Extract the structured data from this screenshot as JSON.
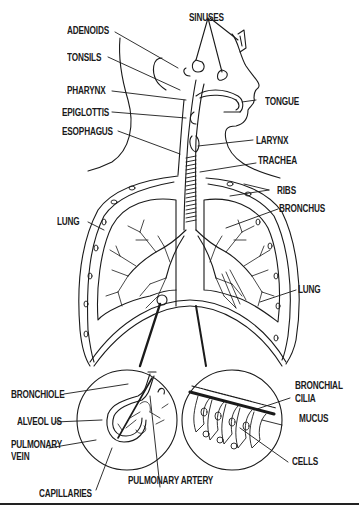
{
  "diagram": {
    "colors": {
      "ink": "#1a1a1a",
      "background": "#ffffff"
    },
    "labels": {
      "adenoids": "ADENOIDS",
      "tonsils": "TONSILS",
      "pharynx": "PHARYNX",
      "epiglottis": "EPIGLOTTIS",
      "esophagus": "ESOPHAGUS",
      "sinuses": "SINUSES",
      "tongue": "TONGUE",
      "larynx": "LARYNX",
      "trachea": "TRACHEA",
      "ribs": "RIBS",
      "bronchus": "BRONCHUS",
      "lung_left": "LUNG",
      "lung_right": "LUNG",
      "bronchiole": "BRONCHIOLE",
      "alveolus": "ALVEOL US",
      "pulmonary_vein_1": "PULMONARY",
      "pulmonary_vein_2": "VEIN",
      "capillaries": "CAPILLARIES",
      "pulmonary_artery": "PULMONARY ARTERY",
      "bronchial_1": "BRONCHIAL",
      "cilia": "CILIA",
      "mucus": "MUCUS",
      "cells": "CELLS"
    },
    "insets": [
      {
        "name": "alveolus-detail",
        "parts": [
          "BRONCHIOLE",
          "ALVEOL US",
          "PULMONARY VEIN",
          "CAPILLARIES",
          "PULMONARY ARTERY"
        ]
      },
      {
        "name": "bronchial-lining-detail",
        "parts": [
          "BRONCHIAL CILIA",
          "MUCUS",
          "CELLS"
        ]
      }
    ]
  }
}
